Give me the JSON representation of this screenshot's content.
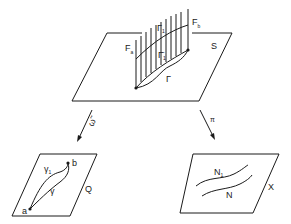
{
  "diagram": {
    "top_plane": {
      "label": "S",
      "fiber_left_label": "F",
      "fiber_left_sub": "a",
      "fiber_right_label": "F",
      "fiber_right_sub": "b",
      "curve_upper_label": "Γ",
      "curve_upper_sub": "1",
      "curve_mid_label": "Γ̄",
      "curve_mid_sub": "1",
      "curve_lower_label": "Γ"
    },
    "left_arrow": {
      "label": "ω̃"
    },
    "right_arrow": {
      "label": "π"
    },
    "left_plane": {
      "label": "Q",
      "point_a": "a",
      "point_b": "b",
      "curve_upper_label": "γ",
      "curve_upper_sub": "1",
      "curve_lower_label": "γ"
    },
    "right_plane": {
      "label": "X",
      "curve_upper_label": "N",
      "curve_upper_sub": "1",
      "curve_lower_label": "N"
    },
    "colors": {
      "ink": "#1a1a1a",
      "background": "#ffffff"
    }
  }
}
